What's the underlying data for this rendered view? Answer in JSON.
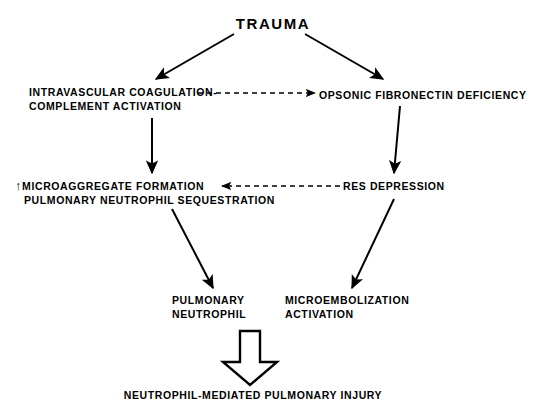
{
  "diagram": {
    "title": "TRAUMA",
    "nodes": {
      "trauma": {
        "label": "TRAUMA"
      },
      "intravascular": {
        "line1": "INTRAVASCULAR COAGULATION-",
        "line2": "COMPLEMENT ACTIVATION"
      },
      "opsonic": {
        "line1": "OPSONIC FIBRONECTIN DEFICIENCY"
      },
      "microaggregate": {
        "marker": "↑",
        "line1": "MICROAGGREGATE FORMATION",
        "line2": "PULMONARY NEUTROPHIL SEQUESTRATION"
      },
      "res": {
        "line1": "RES DEPRESSION"
      },
      "pulmonary_neutrophil": {
        "line1": "PULMONARY",
        "line2": "NEUTROPHIL"
      },
      "microembolization": {
        "line1": "MICROEMBOLIZATION",
        "line2": "ACTIVATION"
      },
      "outcome": {
        "label": "NEUTROPHIL-MEDIATED PULMONARY INJURY"
      }
    },
    "edges": [
      {
        "id": "trauma-to-intravascular",
        "style": "solid",
        "direction": "down-left"
      },
      {
        "id": "trauma-to-opsonic",
        "style": "solid",
        "direction": "down-right"
      },
      {
        "id": "intravascular-to-opsonic",
        "style": "dashed",
        "direction": "right"
      },
      {
        "id": "intravascular-to-microaggregate",
        "style": "solid",
        "direction": "down"
      },
      {
        "id": "opsonic-to-res",
        "style": "solid",
        "direction": "down"
      },
      {
        "id": "res-to-microaggregate",
        "style": "dashed",
        "direction": "left"
      },
      {
        "id": "microaggregate-to-pulmonary-neutrophil",
        "style": "solid",
        "direction": "down-right"
      },
      {
        "id": "res-to-microembolization",
        "style": "solid",
        "direction": "down-left"
      },
      {
        "id": "to-outcome",
        "style": "hollow",
        "direction": "down"
      }
    ],
    "colors": {
      "ink": "#000000",
      "background": "#ffffff"
    }
  }
}
